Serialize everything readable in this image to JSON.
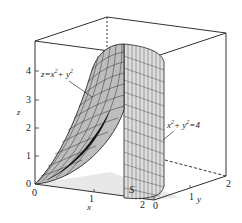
{
  "figure": {
    "type": "3d-surface-plot",
    "surfaces": [
      {
        "name": "paraboloid",
        "equation_label": "z=x²+y²"
      },
      {
        "name": "cylinder",
        "equation_label": "x²+y²=4"
      }
    ],
    "region_label": "S",
    "axes": {
      "x": {
        "label": "x",
        "ticks": [
          "0",
          "1",
          "2"
        ]
      },
      "y": {
        "label": "y",
        "ticks": [
          "0",
          "1",
          "2"
        ]
      },
      "z": {
        "label": "z",
        "ticks": [
          "0",
          "1",
          "2",
          "3",
          "4"
        ]
      }
    },
    "colors": {
      "box": "#333333",
      "mesh": "#1a1a1a",
      "surface_fill": "#d9d9d9",
      "floor": "#e6e6e6",
      "background": "#ffffff"
    }
  }
}
